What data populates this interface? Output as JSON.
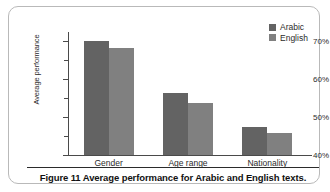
{
  "figure": {
    "caption": "Figure 11 Average performance for Arabic and English texts.",
    "frame_color": "#b9b9b9",
    "background": "#ffffff"
  },
  "legend": {
    "position": "top-right",
    "entries": [
      {
        "label": "Arabic",
        "color": "#636363"
      },
      {
        "label": "English",
        "color": "#808080"
      }
    ]
  },
  "axes": {
    "y_title": "Average performance",
    "y_tick_labels": [
      "70%",
      "60%",
      "50%",
      "40%"
    ],
    "y_minor_ticks": [
      "65%",
      "55%",
      "45%"
    ],
    "x_tick_labels": [
      "Gender",
      "Age range",
      "Nationality"
    ]
  },
  "chart_data": {
    "type": "bar",
    "title": "Figure 11 Average performance for Arabic and English texts.",
    "xlabel": "",
    "ylabel": "Average performance",
    "categories": [
      "Gender",
      "Age range",
      "Nationality"
    ],
    "series": [
      {
        "name": "Arabic",
        "color": "#636363",
        "values": [
          70.0,
          56.3,
          47.3
        ]
      },
      {
        "name": "English",
        "color": "#808080",
        "values": [
          68.0,
          53.7,
          45.9
        ]
      }
    ],
    "ylim": [
      40,
      72
    ],
    "y_major_ticks": [
      40,
      50,
      60,
      70
    ],
    "y_minor_ticks": [
      45,
      55,
      65
    ],
    "y_tick_format": "percent",
    "grid": false,
    "legend_position": "top-right",
    "grouped": true
  }
}
